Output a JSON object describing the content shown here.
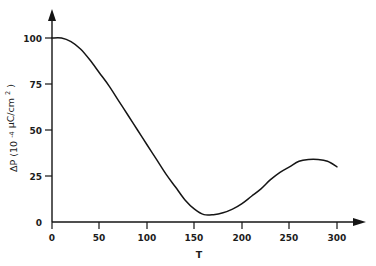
{
  "chart_data": {
    "type": "line",
    "title": "",
    "xlabel": "T",
    "ylabel": "ΔP (10⁻⁴ μC/cm²)",
    "ylabel_parts": {
      "symbol": "ΔP",
      "open_paren": "(10",
      "exponent": "-4",
      "units": "μC/cm",
      "units_exponent": "2",
      "close_paren": ")"
    },
    "xlim": [
      0,
      300
    ],
    "ylim": [
      0,
      100
    ],
    "xticks": [
      0,
      50,
      100,
      150,
      200,
      250,
      300
    ],
    "xtick_labels": [
      "0",
      "50",
      "100",
      "150",
      "200",
      "250",
      "300"
    ],
    "yticks": [
      0,
      25,
      50,
      75,
      100
    ],
    "ytick_labels": [
      "0",
      "25",
      "50",
      "75",
      "100"
    ],
    "grid": false,
    "legend": null,
    "axis_arrows": {
      "x": "right",
      "y": "up"
    },
    "series": [
      {
        "name": "ΔP vs T",
        "color": "#151515",
        "x": [
          0,
          10,
          20,
          30,
          40,
          50,
          60,
          70,
          80,
          90,
          100,
          110,
          120,
          130,
          140,
          150,
          160,
          170,
          180,
          190,
          200,
          210,
          220,
          230,
          240,
          250,
          260,
          270,
          280,
          290,
          300
        ],
        "y": [
          100,
          100,
          98,
          94,
          88,
          81,
          74,
          66,
          58,
          50,
          42,
          34,
          26,
          19,
          12,
          7,
          4,
          4,
          5,
          7,
          10,
          14,
          18,
          23,
          27,
          30,
          33,
          34,
          34,
          33,
          30
        ]
      }
    ],
    "annotations": {
      "plateau_start": {
        "x": 0,
        "y": 100
      },
      "minimum": {
        "x": 162,
        "y": 4
      },
      "local_maximum": {
        "x": 275,
        "y": 34
      },
      "endpoint": {
        "x": 300,
        "y": 30
      }
    }
  }
}
